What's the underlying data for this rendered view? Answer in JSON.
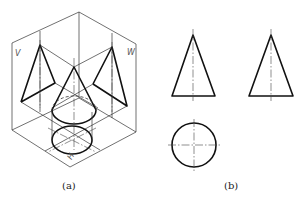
{
  "figure": {
    "panel_a": {
      "caption": "(a)",
      "description": "Isometric projection box showing a cone projected onto V, W and H planes",
      "plane_labels": {
        "v": "V",
        "w": "W",
        "h": "H"
      }
    },
    "panel_b": {
      "caption": "(b)",
      "description": "Three-view orthographic drawing of a cone",
      "views": [
        "front-view-triangle",
        "side-view-triangle",
        "top-view-circle"
      ]
    }
  }
}
